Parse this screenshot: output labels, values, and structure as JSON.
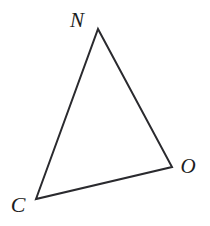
{
  "figure": {
    "kind": "geometry-diagram",
    "shape": "triangle",
    "background_color": "#ffffff",
    "stroke_color": "#2a2a2e",
    "stroke_width": 2,
    "label_color": "#1d1d22",
    "canvas": {
      "width": 210,
      "height": 226
    },
    "vertices": [
      {
        "id": "N",
        "label": "N",
        "x": 98,
        "y": 29,
        "label_x": 77,
        "label_y": 20
      },
      {
        "id": "O",
        "label": "O",
        "x": 172,
        "y": 167,
        "label_x": 188,
        "label_y": 166
      },
      {
        "id": "C",
        "label": "C",
        "x": 36,
        "y": 199,
        "label_x": 18,
        "label_y": 205
      }
    ],
    "edges": [
      {
        "id": "NC",
        "from": "N",
        "to": "C"
      },
      {
        "id": "NO",
        "from": "N",
        "to": "O"
      },
      {
        "id": "CO",
        "from": "C",
        "to": "O"
      }
    ],
    "path": "M 98 29 L 172 167 L 36 199 Z"
  }
}
